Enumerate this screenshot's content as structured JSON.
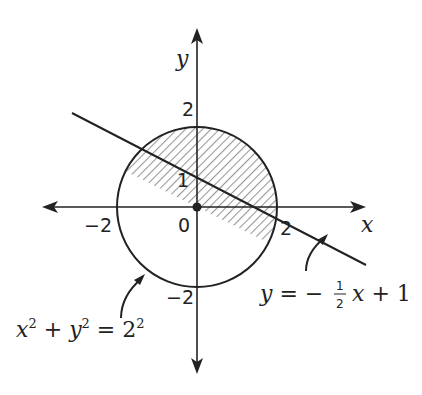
{
  "diagram": {
    "axes": {
      "x_label": "x",
      "y_label": "y",
      "origin_label": "0",
      "tick_labels": {
        "x_neg2": "−2",
        "x_pos2": "2",
        "y_pos1": "1",
        "y_pos2": "2",
        "y_neg2": "−2"
      }
    },
    "circle": {
      "equation": "x² + y² = 2²",
      "center": [
        0,
        0
      ],
      "radius": 2
    },
    "line": {
      "equation_prefix": "y = −",
      "frac_num": "1",
      "frac_den": "2",
      "equation_suffix": "x + 1",
      "slope": -0.5,
      "intercept": 1
    },
    "shaded_region": "circle interior above line",
    "colors": {
      "stroke": "#222222",
      "hatch": "#888888",
      "background": "#ffffff"
    }
  }
}
